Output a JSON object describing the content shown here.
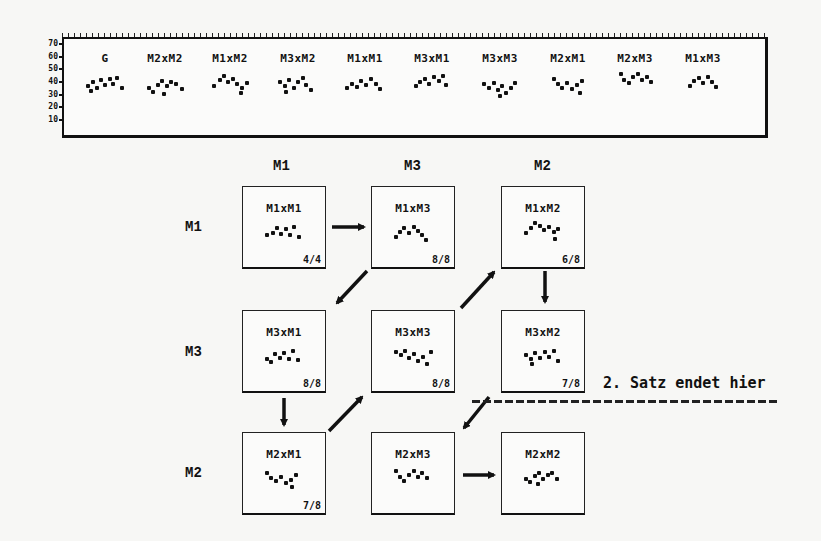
{
  "top_panel": {
    "y_axis_ticks": [
      "70",
      "60",
      "50",
      "40",
      "30",
      "20",
      "10"
    ],
    "labels": [
      "G",
      "M2xM2",
      "M1xM2",
      "M3xM2",
      "M1xM1",
      "M3xM1",
      "M3xM3",
      "M2xM1",
      "M2xM3",
      "M1xM3"
    ]
  },
  "matrix": {
    "column_headers": [
      "M1",
      "M3",
      "M2"
    ],
    "row_headers": [
      "M1",
      "M3",
      "M2"
    ],
    "cells": [
      {
        "label": "M1xM1",
        "fraction": "4/4"
      },
      {
        "label": "M1xM3",
        "fraction": "8/8"
      },
      {
        "label": "M1xM2",
        "fraction": "6/8"
      },
      {
        "label": "M3xM1",
        "fraction": "8/8"
      },
      {
        "label": "M3xM3",
        "fraction": "8/8"
      },
      {
        "label": "M3xM2",
        "fraction": "7/8"
      },
      {
        "label": "M2xM1",
        "fraction": "7/8"
      },
      {
        "label": "M2xM3",
        "fraction": ""
      },
      {
        "label": "M2xM2",
        "fraction": ""
      }
    ],
    "sequence": [
      "M1xM1",
      "M1xM3",
      "M3xM1",
      "M2xM1",
      "M3xM3",
      "M1xM2",
      "M3xM2",
      "M2xM3",
      "M2xM2"
    ]
  },
  "annotation": {
    "text": "2. Satz endet hier"
  }
}
